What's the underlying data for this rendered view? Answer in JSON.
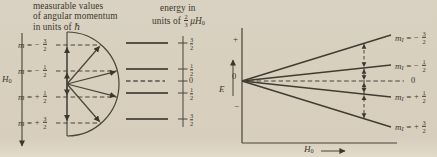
{
  "palette": {
    "bg": "#d8cfbf",
    "ink": "#3b372c",
    "line": "#48443a",
    "level_line": "#57524704"
  },
  "left_panel": {
    "header": {
      "line1": "measurable values",
      "line2": "of angular momentum",
      "line3": "in units of ℏ"
    },
    "field": {
      "symbol": "H",
      "sub": "0"
    },
    "m_labels": [
      {
        "symbol": "m",
        "eq": "=",
        "sign": "−",
        "num": "3",
        "den": "2"
      },
      {
        "symbol": "m",
        "eq": "=",
        "sign": "−",
        "num": "1",
        "den": "2"
      },
      {
        "symbol": "m",
        "eq": "=",
        "sign": "+",
        "num": "1",
        "den": "2"
      },
      {
        "symbol": "m",
        "eq": "=",
        "sign": "+",
        "num": "3",
        "den": "2"
      }
    ]
  },
  "energy_column": {
    "header": {
      "line1": "energy in",
      "prefix": "units of",
      "frac_num": "2",
      "frac_den": "3",
      "unit_symbol": "μH",
      "unit_sub": "0"
    },
    "ticks": [
      {
        "num": "3",
        "den": "2"
      },
      {
        "num": "1",
        "den": "2"
      },
      {
        "zero": "0"
      },
      {
        "num": "1",
        "den": "2"
      },
      {
        "num": "3",
        "den": "2"
      }
    ]
  },
  "e_axis": {
    "plus": "+",
    "symbol": "E",
    "zero": "0",
    "minus": "−"
  },
  "right_panel": {
    "levels": [
      {
        "symbol": "m",
        "sub": "I",
        "eq": "=",
        "sign": "−",
        "num": "3",
        "den": "2"
      },
      {
        "symbol": "m",
        "sub": "I",
        "eq": "=",
        "sign": "−",
        "num": "1",
        "den": "2"
      },
      {
        "symbol": "m",
        "sub": "I",
        "eq": "=",
        "sign": "+",
        "num": "1",
        "den": "2"
      },
      {
        "symbol": "m",
        "sub": "I",
        "eq": "=",
        "sign": "+",
        "num": "3",
        "den": "2"
      }
    ],
    "zero_label": "0",
    "x_axis": {
      "symbol": "H",
      "sub": "0"
    }
  }
}
